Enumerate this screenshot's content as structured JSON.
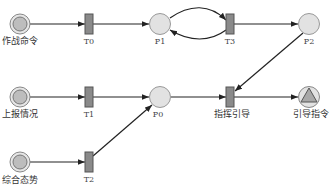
{
  "diagram": {
    "type": "petri-net",
    "colors": {
      "place_fill": "#e2e2e2",
      "place_stroke": "#888888",
      "initial_place_inner": "#bdbdbd",
      "transition_fill": "#8a8a8a",
      "transition_stroke": "#555555",
      "arc": "#222222",
      "background": "#ffffff"
    },
    "places": [
      {
        "id": "start1",
        "label": "作战命令",
        "kind": "source",
        "x": 20,
        "y": 24
      },
      {
        "id": "start2",
        "label": "上报情况",
        "kind": "source",
        "x": 20,
        "y": 97
      },
      {
        "id": "start3",
        "label": "综合态势",
        "kind": "source",
        "x": 20,
        "y": 162
      },
      {
        "id": "P1",
        "label": "P1",
        "kind": "place",
        "x": 160,
        "y": 24
      },
      {
        "id": "P2",
        "label": "P2",
        "kind": "place",
        "x": 309,
        "y": 24
      },
      {
        "id": "P0",
        "label": "P0",
        "kind": "place",
        "x": 160,
        "y": 97
      },
      {
        "id": "end",
        "label": "引导指令",
        "kind": "sink",
        "x": 309,
        "y": 97
      }
    ],
    "transitions": [
      {
        "id": "T0",
        "label": "T0",
        "x": 89,
        "y": 24
      },
      {
        "id": "T3",
        "label": "T3",
        "x": 230,
        "y": 24
      },
      {
        "id": "T1",
        "label": "T1",
        "x": 89,
        "y": 97
      },
      {
        "id": "Tg",
        "label": "指挥引导",
        "x": 230,
        "y": 97
      },
      {
        "id": "T2",
        "label": "T2",
        "x": 89,
        "y": 162
      }
    ],
    "arcs": [
      {
        "from": "作战命令",
        "to": "T0"
      },
      {
        "from": "T0",
        "to": "P1"
      },
      {
        "from": "P1",
        "to": "T3",
        "curve": "upper"
      },
      {
        "from": "T3",
        "to": "P1",
        "curve": "lower"
      },
      {
        "from": "T3",
        "to": "P2"
      },
      {
        "from": "P2",
        "to": "指挥引导"
      },
      {
        "from": "上报情况",
        "to": "T1"
      },
      {
        "from": "T1",
        "to": "P0"
      },
      {
        "from": "P0",
        "to": "指挥引导"
      },
      {
        "from": "指挥引导",
        "to": "引导指令"
      },
      {
        "from": "综合态势",
        "to": "T2"
      },
      {
        "from": "T2",
        "to": "P0"
      }
    ]
  }
}
